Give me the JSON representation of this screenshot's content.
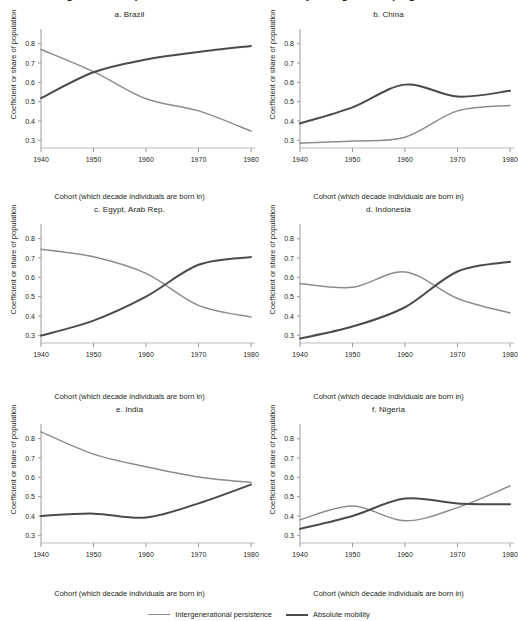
{
  "figure": {
    "title": "Intergenerational persistence and absolute mobility in large developing economies",
    "shared_ylabel": "Coefficient or share of population",
    "shared_xlabel": "Cohort (which decade individuals are born in)"
  },
  "legend": {
    "position": "bottom-center",
    "items": [
      {
        "label": "Intergenerational persistence",
        "color": "#8c8c8c"
      },
      {
        "label": "Absolute mobility",
        "color": "#4a4a50"
      }
    ]
  },
  "axis": {
    "x_ticks": [
      "1940",
      "1950",
      "1960",
      "1970",
      "1980"
    ],
    "y_ticks": [
      "0.3",
      "0.4",
      "0.5",
      "0.6",
      "0.7",
      "0.8"
    ]
  },
  "chart_data": [
    {
      "type": "line",
      "title": "a. Brazil",
      "xlabel": "Cohort (which decade individuals are born in)",
      "ylabel": "Coefficient or share of population",
      "x": [
        1940,
        1950,
        1960,
        1970,
        1980
      ],
      "xlim": [
        1940,
        1980
      ],
      "ylim": [
        0.26,
        0.85
      ],
      "grid": false,
      "series": [
        {
          "name": "Intergenerational persistence",
          "color": "#8c8c8c",
          "values": [
            0.77,
            0.655,
            0.515,
            0.452,
            0.348
          ]
        },
        {
          "name": "Absolute mobility",
          "color": "#4a4a50",
          "values": [
            0.518,
            0.652,
            0.718,
            0.757,
            0.788
          ]
        }
      ]
    },
    {
      "type": "line",
      "title": "b. China",
      "xlabel": "Cohort (which decade individuals are born in)",
      "ylabel": "Coefficient or share of population",
      "x": [
        1940,
        1950,
        1960,
        1970,
        1980
      ],
      "xlim": [
        1940,
        1980
      ],
      "ylim": [
        0.26,
        0.85
      ],
      "grid": false,
      "series": [
        {
          "name": "Intergenerational persistence",
          "color": "#8c8c8c",
          "values": [
            0.285,
            0.296,
            0.316,
            0.452,
            0.48
          ]
        },
        {
          "name": "Absolute mobility",
          "color": "#4a4a50",
          "values": [
            0.387,
            0.47,
            0.588,
            0.526,
            0.556
          ]
        }
      ]
    },
    {
      "type": "line",
      "title": "c. Egypt, Arab Rep.",
      "xlabel": "Cohort (which decade individuals are born in)",
      "ylabel": "Coefficient or share of population",
      "x": [
        1940,
        1950,
        1960,
        1970,
        1980
      ],
      "xlim": [
        1940,
        1980
      ],
      "ylim": [
        0.26,
        0.85
      ],
      "grid": false,
      "series": [
        {
          "name": "Intergenerational persistence",
          "color": "#8c8c8c",
          "values": [
            0.745,
            0.706,
            0.62,
            0.455,
            0.395
          ]
        },
        {
          "name": "Absolute mobility",
          "color": "#4a4a50",
          "values": [
            0.298,
            0.376,
            0.5,
            0.665,
            0.705
          ]
        }
      ]
    },
    {
      "type": "line",
      "title": "d. Indonesia",
      "xlabel": "Cohort (which decade individuals are born in)",
      "ylabel": "Coefficient or share of population",
      "x": [
        1940,
        1950,
        1960,
        1970,
        1980
      ],
      "xlim": [
        1940,
        1980
      ],
      "ylim": [
        0.26,
        0.85
      ],
      "grid": false,
      "series": [
        {
          "name": "Intergenerational persistence",
          "color": "#8c8c8c",
          "values": [
            0.568,
            0.548,
            0.628,
            0.49,
            0.415
          ]
        },
        {
          "name": "Absolute mobility",
          "color": "#4a4a50",
          "values": [
            0.283,
            0.345,
            0.445,
            0.63,
            0.68
          ]
        }
      ]
    },
    {
      "type": "line",
      "title": "e. India",
      "xlabel": "Cohort (which decade individuals are born in)",
      "ylabel": "Coefficient or share of population",
      "x": [
        1940,
        1950,
        1960,
        1970,
        1980
      ],
      "xlim": [
        1940,
        1980
      ],
      "ylim": [
        0.26,
        0.85
      ],
      "grid": false,
      "series": [
        {
          "name": "Intergenerational persistence",
          "color": "#8c8c8c",
          "values": [
            0.835,
            0.72,
            0.655,
            0.602,
            0.573
          ]
        },
        {
          "name": "Absolute mobility",
          "color": "#4a4a50",
          "values": [
            0.4,
            0.412,
            0.392,
            0.465,
            0.562
          ]
        }
      ]
    },
    {
      "type": "line",
      "title": "f. Nigeria",
      "xlabel": "Cohort (which decade individuals are born in)",
      "ylabel": "Coefficient or share of population",
      "x": [
        1940,
        1950,
        1960,
        1970,
        1980
      ],
      "xlim": [
        1940,
        1980
      ],
      "ylim": [
        0.26,
        0.85
      ],
      "grid": false,
      "series": [
        {
          "name": "Intergenerational persistence",
          "color": "#8c8c8c",
          "values": [
            0.38,
            0.452,
            0.375,
            0.443,
            0.555
          ]
        },
        {
          "name": "Absolute mobility",
          "color": "#4a4a50",
          "values": [
            0.333,
            0.4,
            0.49,
            0.465,
            0.46
          ]
        }
      ]
    }
  ]
}
